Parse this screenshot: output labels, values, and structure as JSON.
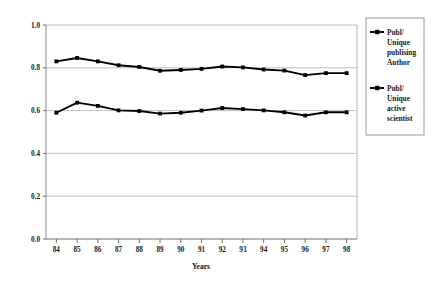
{
  "chart_data": {
    "type": "line",
    "title": "",
    "xlabel": "Years",
    "ylabel": "Ratio",
    "categories": [
      "84",
      "85",
      "86",
      "87",
      "88",
      "89",
      "90",
      "91",
      "92",
      "93",
      "94",
      "95",
      "96",
      "97",
      "98"
    ],
    "x": [
      84,
      85,
      86,
      87,
      88,
      89,
      90,
      91,
      92,
      93,
      94,
      95,
      96,
      97,
      98
    ],
    "ylim": [
      0.0,
      1.0
    ],
    "yticks": [
      "0.0",
      "0.2",
      "0.4",
      "0.6",
      "0.8",
      "1.0"
    ],
    "ytick_values": [
      0.0,
      0.2,
      0.4,
      0.6,
      0.8,
      1.0
    ],
    "grid": "horizontal",
    "legend_position": "right",
    "series": [
      {
        "name": "Publ/ Unique publising Author",
        "legend_lines": [
          "Publ/",
          "Unique",
          "publising",
          "Author"
        ],
        "color": "#000000",
        "marker": "square",
        "values": [
          0.83,
          0.846,
          0.83,
          0.812,
          0.804,
          0.786,
          0.79,
          0.795,
          0.806,
          0.802,
          0.792,
          0.787,
          0.766,
          0.775,
          0.775
        ]
      },
      {
        "name": "Publ/ Unique active scientist",
        "legend_lines": [
          "Publ/",
          "Unique",
          "active",
          "scientist"
        ],
        "color": "#000000",
        "marker": "square",
        "values": [
          0.59,
          0.637,
          0.622,
          0.601,
          0.598,
          0.586,
          0.59,
          0.6,
          0.612,
          0.607,
          0.601,
          0.592,
          0.577,
          0.592,
          0.592
        ]
      }
    ]
  },
  "axes": {
    "y_title": "Ratio",
    "x_title": "Years"
  },
  "legend": {
    "entries": [
      {
        "label": "Publ/ Unique publising Author",
        "lines": [
          "Publ/",
          "Unique",
          "publising",
          "Author"
        ]
      },
      {
        "label": "Publ/ Unique active scientist",
        "lines": [
          "Publ/",
          "Unique",
          "active",
          "scientist"
        ]
      }
    ]
  },
  "colors": {
    "series": "#000000",
    "gridline": "#b9b9b9",
    "axis": "#8a8a8a",
    "legend_border": "#9a9a9a",
    "background": "#ffffff"
  }
}
